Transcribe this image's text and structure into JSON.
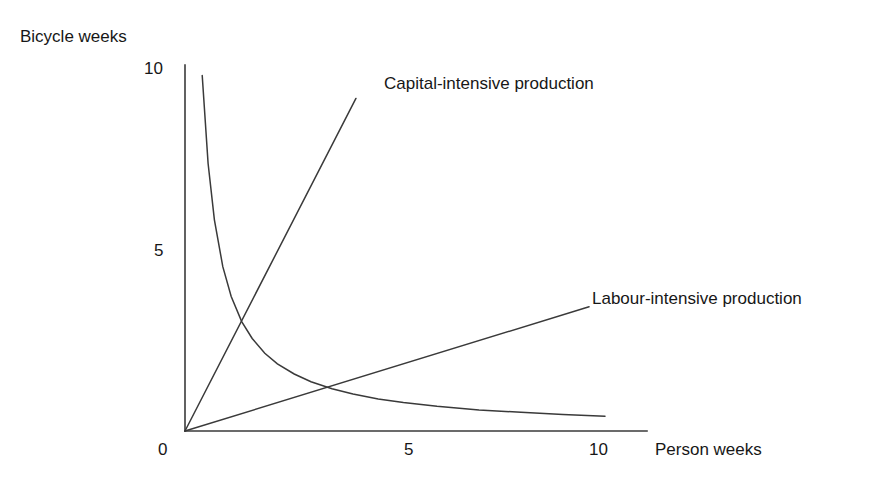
{
  "figure": {
    "background": "#ffffff",
    "ink_color": "#333333",
    "text_color": "#171717"
  },
  "chart_data": {
    "type": "line",
    "title": "",
    "subtitle": "",
    "xlabel": "Person weeks",
    "ylabel": "Bicycle weeks",
    "xlim": [
      0,
      11
    ],
    "ylim": [
      0,
      10.4
    ],
    "grid": false,
    "legend_position": "inline-annotation",
    "xticks": [
      0,
      5,
      10
    ],
    "xticklabels": [
      "0",
      "5",
      "10"
    ],
    "yticks": [
      10,
      5
    ],
    "yticklabels": [
      "10",
      "5"
    ],
    "annotations": [
      {
        "name": "capital-intensive-production",
        "text": "Capital-intensive production",
        "anchor_xy": [
          4.07,
          9.45
        ]
      },
      {
        "name": "labour-intensive-production",
        "text": "Labour-intensive production",
        "anchor_xy": [
          9.6,
          3.53
        ]
      }
    ],
    "series": [
      {
        "name": "isoquant",
        "label": "",
        "type": "curve",
        "form": "y = 4.2 / x",
        "x": [
          0.41,
          0.55,
          0.7,
          0.9,
          1.1,
          1.35,
          1.6,
          1.9,
          2.2,
          2.6,
          3.0,
          3.5,
          4.0,
          4.6,
          5.2,
          6.0,
          7.0,
          8.0,
          9.0,
          10.0
        ],
        "y": [
          10.1,
          7.6,
          6.0,
          4.67,
          3.82,
          3.11,
          2.63,
          2.21,
          1.91,
          1.62,
          1.4,
          1.2,
          1.05,
          0.91,
          0.81,
          0.7,
          0.6,
          0.53,
          0.47,
          0.42
        ]
      },
      {
        "name": "capital-intensive-ray",
        "label": "Capital-intensive production",
        "type": "line",
        "x": [
          0,
          4.07
        ],
        "y": [
          0,
          9.45
        ]
      },
      {
        "name": "labour-intensive-ray",
        "label": "Labour-intensive production",
        "type": "line",
        "x": [
          0,
          9.62
        ],
        "y": [
          0,
          3.53
        ]
      }
    ],
    "intersections": [
      {
        "name": "capital-isoquant",
        "x": 2.12,
        "y": 4.45
      },
      {
        "name": "labour-isoquant",
        "x": 5.07,
        "y": 1.88
      }
    ]
  }
}
